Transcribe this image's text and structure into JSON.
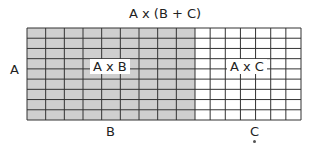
{
  "title": "A x (B + C)",
  "labels": {
    "side": "A",
    "bottom_b": "B",
    "bottom_c": "C",
    "region_b": "A x B",
    "region_c": "A x C"
  },
  "grid": {
    "rows": 9,
    "cols_b": 9,
    "cols_c": 7,
    "shade_color": "#cfcfcf",
    "line_color": "#333333"
  }
}
